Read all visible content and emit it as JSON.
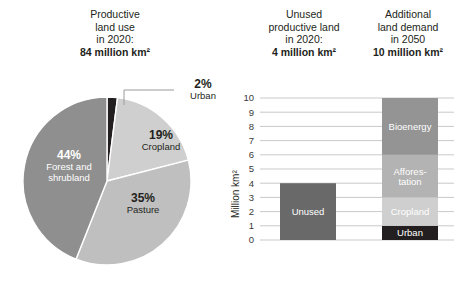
{
  "panels": {
    "pie_header": {
      "l1": "Productive",
      "l2": "land use",
      "l3": "in 2020:",
      "l4": "84 million km²"
    },
    "unused_header": {
      "l1": "Unused",
      "l2": "productive land",
      "l3": "in 2020:",
      "l4": "4 million km²"
    },
    "demand_header": {
      "l1": "Additional",
      "l2": "land demand",
      "l3": "in 2050",
      "l4": "10 million km²"
    }
  },
  "colors": {
    "urban": "#231f20",
    "cropland": "#cfcfcf",
    "pasture": "#bfbfbf",
    "forest": "#8f8f8f",
    "unused_bar": "#696969",
    "bioenergy": "#949494",
    "afforestation": "#b3b3b3",
    "gridline": "#c9c9c9",
    "text": "#231f20"
  },
  "chart_data": [
    {
      "type": "pie",
      "title": "Productive land use in 2020: 84 million km²",
      "unit": "million km²",
      "total": 84,
      "categories": [
        "Urban",
        "Cropland",
        "Pasture",
        "Forest and shrubland"
      ],
      "values": [
        2,
        19,
        35,
        44
      ],
      "labels": [
        "2%",
        "19%",
        "35%",
        "44%"
      ],
      "slices": [
        {
          "name": "Urban",
          "pct": 2,
          "pct_label": "2%",
          "name_l1": "Urban",
          "name_l2": "",
          "color": "#231f20",
          "label_placement": "outside-leader"
        },
        {
          "name": "Cropland",
          "pct": 19,
          "pct_label": "19%",
          "name_l1": "Cropland",
          "name_l2": "",
          "color": "#cfcfcf",
          "label_placement": "inside"
        },
        {
          "name": "Pasture",
          "pct": 35,
          "pct_label": "35%",
          "name_l1": "Pasture",
          "name_l2": "",
          "color": "#bfbfbf",
          "label_placement": "inside"
        },
        {
          "name": "Forest and shrubland",
          "pct": 44,
          "pct_label": "44%",
          "name_l1": "Forest and",
          "name_l2": "shrubland",
          "color": "#8f8f8f",
          "label_placement": "inside"
        }
      ],
      "start_angle_deg": 0,
      "direction": "clockwise",
      "legend": "none"
    },
    {
      "type": "bar",
      "subtype": "stacked",
      "ylabel": "Million km²",
      "ylim": [
        0,
        10
      ],
      "yticks": [
        "0",
        "1",
        "2",
        "3",
        "4",
        "5",
        "6",
        "7",
        "8",
        "9",
        "10"
      ],
      "grid": true,
      "legend": "none",
      "categories": [
        "Unused",
        "Additional land demand"
      ],
      "bars": [
        {
          "category": "Unused",
          "total": 4,
          "segments": [
            {
              "name": "Unused",
              "label_l1": "Unused",
              "label_l2": "",
              "value": 4,
              "from": 0,
              "to": 4,
              "color": "#696969"
            }
          ]
        },
        {
          "category": "Additional land demand",
          "total": 10,
          "segments": [
            {
              "name": "Urban",
              "label_l1": "Urban",
              "label_l2": "",
              "value": 1,
              "from": 0,
              "to": 1,
              "color": "#231f20"
            },
            {
              "name": "Cropland",
              "label_l1": "Cropland",
              "label_l2": "",
              "value": 2,
              "from": 1,
              "to": 3,
              "color": "#cfcfcf"
            },
            {
              "name": "Afforestation",
              "label_l1": "Affores-",
              "label_l2": "tation",
              "value": 3,
              "from": 3,
              "to": 6,
              "color": "#b3b3b3"
            },
            {
              "name": "Bioenergy",
              "label_l1": "Bioenergy",
              "label_l2": "",
              "value": 4,
              "from": 6,
              "to": 10,
              "color": "#949494"
            }
          ]
        }
      ]
    }
  ]
}
